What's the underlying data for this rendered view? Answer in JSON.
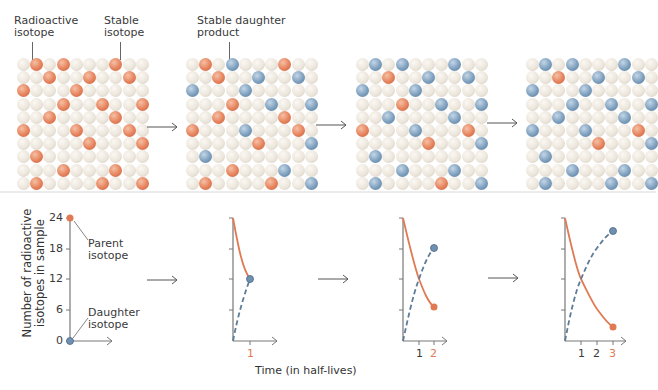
{
  "colors": {
    "parent": "#e07a52",
    "daughter": "#6f90b0",
    "stable": "#ece6dc",
    "axis": "#666666"
  },
  "labels": {
    "radioactive": "Radioactive\nisotope",
    "stable": "Stable\nisotope",
    "daughter_product": "Stable daughter\nproduct",
    "parent_isotope": "Parent\nisotope",
    "daughter_isotope": "Daughter\nisotope",
    "y_axis": "Number of radioactive\nisotopes in sample",
    "x_axis": "Time (in half-lives)"
  },
  "grids": [
    {
      "name": "t0",
      "orange": [
        [
          0,
          1
        ],
        [
          0,
          3
        ],
        [
          0,
          7
        ],
        [
          1,
          2
        ],
        [
          1,
          5
        ],
        [
          1,
          8
        ],
        [
          2,
          0
        ],
        [
          2,
          4
        ],
        [
          3,
          3
        ],
        [
          3,
          6
        ],
        [
          3,
          9
        ],
        [
          4,
          2
        ],
        [
          4,
          7
        ],
        [
          5,
          0
        ],
        [
          5,
          4
        ],
        [
          5,
          8
        ],
        [
          6,
          5
        ],
        [
          6,
          9
        ],
        [
          7,
          1
        ],
        [
          8,
          3
        ],
        [
          8,
          7
        ],
        [
          9,
          1
        ],
        [
          9,
          6
        ],
        [
          9,
          9
        ]
      ],
      "blue": []
    },
    {
      "name": "t1",
      "orange": [
        [
          0,
          1
        ],
        [
          0,
          7
        ],
        [
          1,
          2
        ],
        [
          3,
          3
        ],
        [
          4,
          2
        ],
        [
          4,
          7
        ],
        [
          5,
          0
        ],
        [
          5,
          8
        ],
        [
          6,
          5
        ],
        [
          8,
          3
        ],
        [
          9,
          1
        ],
        [
          9,
          6
        ]
      ],
      "blue": [
        [
          0,
          3
        ],
        [
          1,
          5
        ],
        [
          1,
          8
        ],
        [
          2,
          0
        ],
        [
          2,
          4
        ],
        [
          3,
          6
        ],
        [
          3,
          9
        ],
        [
          5,
          4
        ],
        [
          6,
          9
        ],
        [
          7,
          1
        ],
        [
          8,
          7
        ],
        [
          9,
          9
        ]
      ]
    },
    {
      "name": "t2",
      "orange": [
        [
          1,
          2
        ],
        [
          3,
          3
        ],
        [
          5,
          0
        ],
        [
          5,
          8
        ],
        [
          6,
          5
        ],
        [
          9,
          6
        ]
      ],
      "blue": [
        [
          0,
          1
        ],
        [
          0,
          3
        ],
        [
          0,
          7
        ],
        [
          1,
          5
        ],
        [
          1,
          8
        ],
        [
          2,
          0
        ],
        [
          2,
          4
        ],
        [
          3,
          6
        ],
        [
          3,
          9
        ],
        [
          4,
          2
        ],
        [
          4,
          7
        ],
        [
          5,
          4
        ],
        [
          6,
          9
        ],
        [
          7,
          1
        ],
        [
          8,
          3
        ],
        [
          8,
          7
        ],
        [
          9,
          1
        ],
        [
          9,
          9
        ]
      ]
    },
    {
      "name": "t3",
      "orange": [
        [
          1,
          2
        ],
        [
          5,
          8
        ],
        [
          6,
          5
        ]
      ],
      "blue": [
        [
          0,
          1
        ],
        [
          0,
          3
        ],
        [
          0,
          7
        ],
        [
          1,
          5
        ],
        [
          1,
          8
        ],
        [
          2,
          0
        ],
        [
          2,
          4
        ],
        [
          3,
          3
        ],
        [
          3,
          6
        ],
        [
          3,
          9
        ],
        [
          4,
          2
        ],
        [
          4,
          7
        ],
        [
          5,
          0
        ],
        [
          5,
          4
        ],
        [
          6,
          9
        ],
        [
          7,
          1
        ],
        [
          8,
          3
        ],
        [
          8,
          7
        ],
        [
          9,
          1
        ],
        [
          9,
          6
        ],
        [
          9,
          9
        ]
      ]
    }
  ],
  "chart_data": [
    {
      "type": "line",
      "title": "t = 0",
      "x": [
        0
      ],
      "series": [
        {
          "name": "Parent isotope",
          "values": [
            24
          ]
        },
        {
          "name": "Daughter isotope",
          "values": [
            0
          ]
        }
      ],
      "ylabel": "Number of radioactive isotopes in sample",
      "yticks": [
        0,
        6,
        12,
        18,
        24
      ],
      "ylim": [
        0,
        24
      ]
    },
    {
      "type": "line",
      "title": "t = 1",
      "x": [
        0,
        1
      ],
      "series": [
        {
          "name": "Parent isotope",
          "values": [
            24,
            12
          ]
        },
        {
          "name": "Daughter isotope",
          "values": [
            0,
            12
          ]
        }
      ],
      "xticks": [
        "1"
      ],
      "ylim": [
        0,
        24
      ]
    },
    {
      "type": "line",
      "title": "t = 2",
      "x": [
        0,
        1,
        2
      ],
      "series": [
        {
          "name": "Parent isotope",
          "values": [
            24,
            12,
            6
          ]
        },
        {
          "name": "Daughter isotope",
          "values": [
            0,
            12,
            18
          ]
        }
      ],
      "xticks": [
        "1",
        "2"
      ],
      "ylim": [
        0,
        24
      ]
    },
    {
      "type": "line",
      "title": "t = 3",
      "x": [
        0,
        1,
        2,
        3
      ],
      "series": [
        {
          "name": "Parent isotope",
          "values": [
            24,
            12,
            6,
            3
          ]
        },
        {
          "name": "Daughter isotope",
          "values": [
            0,
            12,
            18,
            21
          ]
        }
      ],
      "xticks": [
        "1",
        "2",
        "3"
      ],
      "xlabel": "Time (in half-lives)",
      "ylim": [
        0,
        24
      ]
    }
  ],
  "y_ticks": [
    "24",
    "18",
    "12",
    "6",
    "0"
  ],
  "x_ticks": {
    "g2": [
      "1"
    ],
    "g3": [
      "1",
      "2"
    ],
    "g4": [
      "1",
      "2",
      "3"
    ]
  }
}
